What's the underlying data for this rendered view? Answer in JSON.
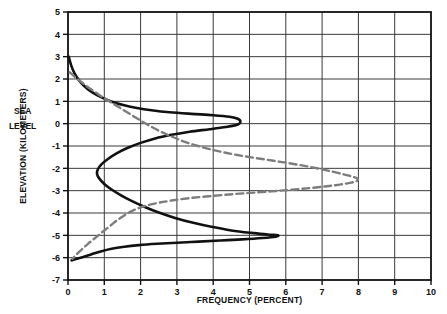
{
  "chart_data": {
    "type": "line",
    "title": "",
    "xlabel": "FREQUENCY (PERCENT)",
    "ylabel": "ELEVATION (KILOMETERS)",
    "xlim": [
      0,
      10
    ],
    "ylim": [
      -7,
      5
    ],
    "xticks": [
      0,
      1,
      2,
      3,
      4,
      5,
      6,
      7,
      8,
      9,
      10
    ],
    "yticks": [
      5,
      4,
      3,
      2,
      1,
      0,
      -1,
      -2,
      -3,
      -4,
      -5,
      -6,
      -7
    ],
    "xtick_labels": [
      "0",
      "1",
      "2",
      "3",
      "4",
      "5",
      "6",
      "7",
      "8",
      "9",
      "10"
    ],
    "ytick_labels": [
      "5",
      "4",
      "3",
      "2",
      "1",
      "0",
      "-1",
      "-2",
      "-3",
      "-4",
      "-5",
      "-6",
      "-7"
    ],
    "grid": true,
    "legend_position": "none",
    "annotations": [
      {
        "text": "SEA",
        "x_value": -1.25,
        "y_value": 0.55
      },
      {
        "text": "LEVEL",
        "x_value": -1.25,
        "y_value": -0.1
      }
    ],
    "series": [
      {
        "name": "frequency-curve-solid",
        "style": "solid",
        "color": "#111111",
        "linewidth": 2.6,
        "points": [
          [
            0.02,
            3.0
          ],
          [
            0.09,
            2.6
          ],
          [
            0.18,
            2.25
          ],
          [
            0.3,
            1.95
          ],
          [
            0.44,
            1.7
          ],
          [
            0.6,
            1.48
          ],
          [
            0.8,
            1.28
          ],
          [
            1.0,
            1.12
          ],
          [
            1.25,
            0.96
          ],
          [
            1.55,
            0.82
          ],
          [
            1.9,
            0.7
          ],
          [
            2.3,
            0.6
          ],
          [
            2.8,
            0.51
          ],
          [
            3.4,
            0.44
          ],
          [
            4.0,
            0.38
          ],
          [
            4.45,
            0.31
          ],
          [
            4.68,
            0.22
          ],
          [
            4.75,
            0.08
          ],
          [
            4.66,
            -0.05
          ],
          [
            4.35,
            -0.15
          ],
          [
            3.9,
            -0.25
          ],
          [
            3.35,
            -0.36
          ],
          [
            2.85,
            -0.5
          ],
          [
            2.4,
            -0.66
          ],
          [
            2.0,
            -0.86
          ],
          [
            1.65,
            -1.08
          ],
          [
            1.35,
            -1.32
          ],
          [
            1.1,
            -1.58
          ],
          [
            0.92,
            -1.82
          ],
          [
            0.82,
            -2.05
          ],
          [
            0.8,
            -2.25
          ],
          [
            0.86,
            -2.45
          ],
          [
            1.0,
            -2.7
          ],
          [
            1.2,
            -2.95
          ],
          [
            1.45,
            -3.2
          ],
          [
            1.75,
            -3.46
          ],
          [
            2.1,
            -3.72
          ],
          [
            2.5,
            -3.98
          ],
          [
            2.95,
            -4.22
          ],
          [
            3.45,
            -4.44
          ],
          [
            3.95,
            -4.62
          ],
          [
            4.5,
            -4.78
          ],
          [
            5.05,
            -4.89
          ],
          [
            5.5,
            -4.96
          ],
          [
            5.78,
            -5.0
          ],
          [
            5.72,
            -5.06
          ],
          [
            5.35,
            -5.12
          ],
          [
            4.8,
            -5.18
          ],
          [
            4.2,
            -5.23
          ],
          [
            3.6,
            -5.28
          ],
          [
            3.0,
            -5.33
          ],
          [
            2.45,
            -5.38
          ],
          [
            1.95,
            -5.44
          ],
          [
            1.55,
            -5.51
          ],
          [
            1.2,
            -5.6
          ],
          [
            0.9,
            -5.72
          ],
          [
            0.65,
            -5.85
          ],
          [
            0.42,
            -5.97
          ],
          [
            0.22,
            -6.06
          ],
          [
            0.1,
            -6.12
          ]
        ]
      },
      {
        "name": "cumulative-curve-dashed",
        "style": "dashed",
        "color": "#7d7d7d",
        "linewidth": 2.4,
        "dasharray": "7,4",
        "points": [
          [
            0.05,
            2.3
          ],
          [
            0.22,
            2.05
          ],
          [
            0.4,
            1.82
          ],
          [
            0.58,
            1.6
          ],
          [
            0.78,
            1.38
          ],
          [
            0.98,
            1.16
          ],
          [
            1.2,
            0.94
          ],
          [
            1.42,
            0.72
          ],
          [
            1.64,
            0.5
          ],
          [
            1.86,
            0.28
          ],
          [
            2.08,
            0.06
          ],
          [
            2.32,
            -0.16
          ],
          [
            2.58,
            -0.38
          ],
          [
            2.86,
            -0.58
          ],
          [
            3.16,
            -0.78
          ],
          [
            3.5,
            -0.96
          ],
          [
            3.88,
            -1.13
          ],
          [
            4.28,
            -1.28
          ],
          [
            4.72,
            -1.42
          ],
          [
            5.18,
            -1.54
          ],
          [
            5.66,
            -1.66
          ],
          [
            6.12,
            -1.78
          ],
          [
            6.56,
            -1.9
          ],
          [
            6.96,
            -2.03
          ],
          [
            7.32,
            -2.16
          ],
          [
            7.62,
            -2.28
          ],
          [
            7.85,
            -2.38
          ],
          [
            7.98,
            -2.47
          ],
          [
            7.96,
            -2.56
          ],
          [
            7.8,
            -2.64
          ],
          [
            7.52,
            -2.72
          ],
          [
            7.14,
            -2.8
          ],
          [
            6.68,
            -2.88
          ],
          [
            6.16,
            -2.96
          ],
          [
            5.6,
            -3.03
          ],
          [
            5.02,
            -3.1
          ],
          [
            4.44,
            -3.17
          ],
          [
            3.88,
            -3.25
          ],
          [
            3.36,
            -3.33
          ],
          [
            2.9,
            -3.43
          ],
          [
            2.5,
            -3.54
          ],
          [
            2.18,
            -3.66
          ],
          [
            1.92,
            -3.8
          ],
          [
            1.7,
            -3.96
          ],
          [
            1.52,
            -4.14
          ],
          [
            1.34,
            -4.34
          ],
          [
            1.18,
            -4.55
          ],
          [
            1.02,
            -4.76
          ],
          [
            0.86,
            -4.97
          ],
          [
            0.7,
            -5.18
          ],
          [
            0.55,
            -5.38
          ],
          [
            0.42,
            -5.57
          ],
          [
            0.3,
            -5.75
          ],
          [
            0.2,
            -5.92
          ],
          [
            0.12,
            -6.05
          ]
        ]
      }
    ]
  },
  "axes": {
    "plot_left_px": 68,
    "plot_right_px": 431,
    "plot_top_px": 12,
    "plot_bottom_px": 280
  }
}
